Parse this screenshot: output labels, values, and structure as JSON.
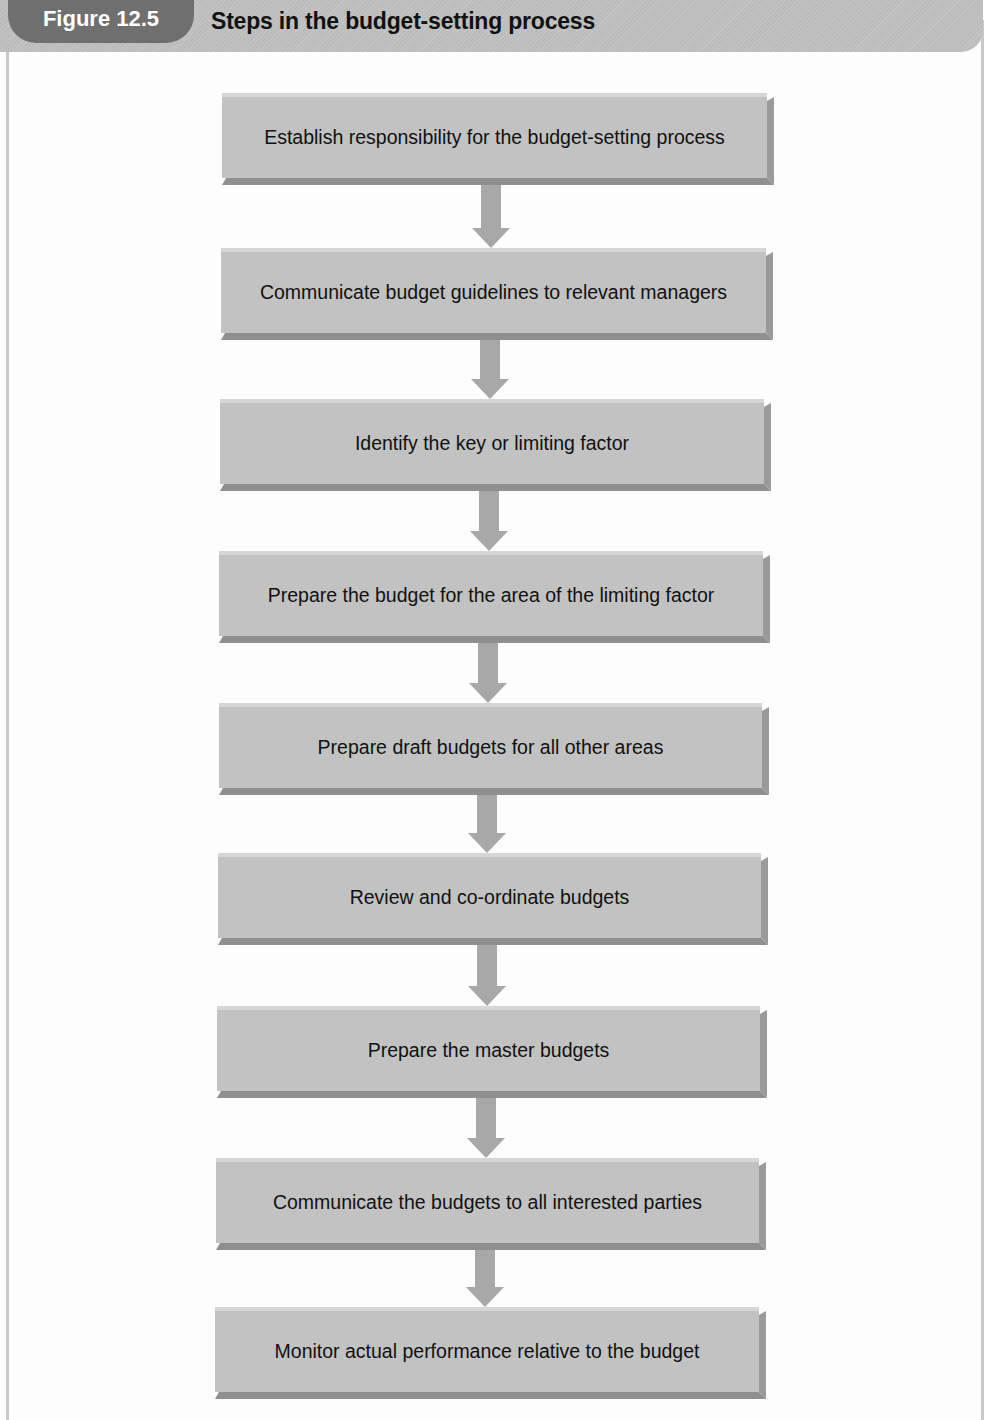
{
  "header": {
    "figure_label": "Figure 12.5",
    "title": "Steps in the budget-setting process"
  },
  "colors": {
    "tab_bg": "#6f6f6f",
    "header_bar": "#c0c0c0",
    "box_face": "#c2c2c2",
    "box_edge": "#8f8f8f",
    "arrow": "#a8a8a8"
  },
  "steps": [
    {
      "label": "Establish responsibility for the budget-setting process"
    },
    {
      "label": "Communicate budget guidelines to relevant managers"
    },
    {
      "label": "Identify the key or limiting factor"
    },
    {
      "label": "Prepare the budget for the area of the limiting factor"
    },
    {
      "label": "Prepare draft budgets for all other areas"
    },
    {
      "label": "Review and co-ordinate budgets"
    },
    {
      "label": "Prepare the master budgets"
    },
    {
      "label": "Communicate the budgets to all interested parties"
    },
    {
      "label": "Monitor actual performance relative to the budget"
    }
  ]
}
